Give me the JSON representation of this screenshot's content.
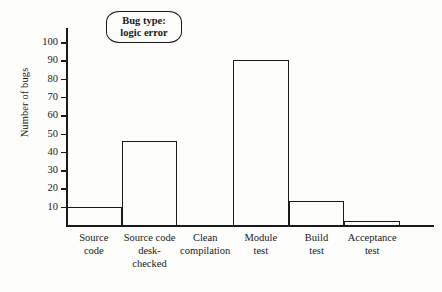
{
  "chart_data": {
    "type": "bar",
    "title": "",
    "subtitle": "",
    "xlabel": "",
    "ylabel": "Number of bugs",
    "categories": [
      "Source code",
      "Source code desk-checked",
      "Clean compilation",
      "Module test",
      "Build test",
      "Acceptance test"
    ],
    "category_lines": [
      [
        "Source",
        "code"
      ],
      [
        "Source code",
        "desk-",
        "checked"
      ],
      [
        "Clean",
        "compilation"
      ],
      [
        "Module",
        "test"
      ],
      [
        "Build",
        "test"
      ],
      [
        "Acceptance",
        "test"
      ]
    ],
    "values": [
      10,
      46,
      0,
      90,
      13,
      2
    ],
    "ylim": [
      0,
      105
    ],
    "ytick_values": [
      10,
      20,
      30,
      40,
      50,
      60,
      70,
      80,
      90,
      100
    ],
    "ytick_labels": [
      "10",
      "20",
      "30",
      "40",
      "50",
      "60",
      "70",
      "80",
      "90",
      "100"
    ],
    "grid": false,
    "legend": "none",
    "bar_fill": "none",
    "bar_outline": "#1a1a1a"
  },
  "callout": {
    "line1": "Bug type:",
    "line2": "logic error"
  },
  "colors": {
    "ink": "#1a1a1a",
    "background": "#fdfdfb"
  }
}
